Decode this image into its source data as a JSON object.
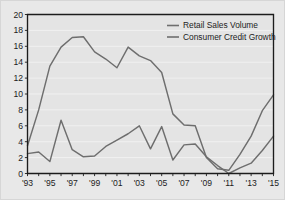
{
  "figure": {
    "background_color": "#e8e8e8",
    "plot_background_color": "#e4e4e4",
    "gridline_color": "#f4f4f4",
    "axis_color": "#1c1c1c",
    "border_color": "#d6d6d6"
  },
  "chart_data": {
    "type": "line",
    "title": "",
    "subtitle": "",
    "xlabel": "",
    "ylabel": "",
    "xlim": [
      1993,
      2015
    ],
    "ylim": [
      0,
      20
    ],
    "yticks": [
      0,
      2,
      4,
      6,
      8,
      10,
      12,
      14,
      16,
      18,
      20
    ],
    "ytick_labels": [
      "0",
      "2",
      "4",
      "6",
      "8",
      "10",
      "12",
      "14",
      "16",
      "18",
      "20"
    ],
    "xticks": [
      1993,
      1994,
      1995,
      1996,
      1997,
      1998,
      1999,
      2000,
      2001,
      2002,
      2003,
      2004,
      2005,
      2006,
      2007,
      2008,
      2009,
      2010,
      2011,
      2012,
      2013,
      2014,
      2015
    ],
    "xtick_labels_shown": [
      "'93",
      "'95",
      "'97",
      "'99",
      "'01",
      "'03",
      "'05",
      "'07",
      "'09",
      "'11",
      "'13",
      "'15"
    ],
    "xtick_label_years": [
      1993,
      1995,
      1997,
      1999,
      2001,
      2003,
      2005,
      2007,
      2009,
      2011,
      2013,
      2015
    ],
    "grid": true,
    "grid_axis": "y",
    "legend_position": "top-right",
    "x": [
      1993,
      1994,
      1995,
      1996,
      1997,
      1998,
      1999,
      2000,
      2001,
      2002,
      2003,
      2004,
      2005,
      2006,
      2007,
      2008,
      2009,
      2010,
      2011,
      2012,
      2013,
      2014,
      2015
    ],
    "series": [
      {
        "name": "Retail Sales Volume",
        "color": "#6e6e6e",
        "values": [
          2.5,
          2.7,
          1.5,
          6.7,
          3.0,
          2.1,
          2.2,
          3.4,
          4.2,
          5.0,
          6.0,
          3.1,
          5.9,
          1.7,
          3.6,
          3.7,
          2.1,
          1.0,
          0.0,
          0.7,
          1.3,
          2.9,
          4.7
        ]
      },
      {
        "name": "Consumer Credit Growth",
        "color": "#6e6e6e",
        "values": [
          3.5,
          8.0,
          13.5,
          15.9,
          17.1,
          17.2,
          15.3,
          14.4,
          13.3,
          15.9,
          14.8,
          14.2,
          12.7,
          7.5,
          6.1,
          6.0,
          2.0,
          0.6,
          0.4,
          2.4,
          4.7,
          7.9,
          9.9
        ]
      }
    ]
  },
  "legend": {
    "entries": [
      {
        "label": "Retail Sales Volume",
        "color": "#6e6e6e"
      },
      {
        "label": "Consumer Credit Growth",
        "color": "#6e6e6e"
      }
    ]
  }
}
